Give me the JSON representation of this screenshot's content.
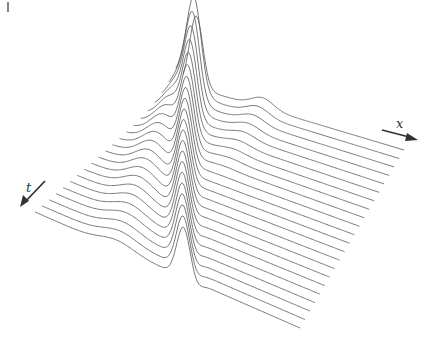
{
  "figure": {
    "axes": {
      "x_label": "x",
      "t_label": "t"
    },
    "colors": {
      "curve": "#555555",
      "axis": "#333333",
      "background": "#ffffff"
    }
  },
  "chart_data": {
    "type": "line",
    "title": "",
    "xlabel": "x",
    "ylabel": "t",
    "num_curves": 22,
    "layout": {
      "back_left": [
        183,
        84
      ],
      "front_left": [
        35,
        212
      ],
      "back_right": [
        404,
        150
      ],
      "front_right": [
        300,
        328
      ]
    },
    "series_description": "Each curve is a time slice; a tall initial peak at u≈0.05 splits into a left-moving packet and a right-moving packet; a small secondary bump travels at u≈0.4 in early slices",
    "pulses": {
      "initial_peak": {
        "u": 0.06,
        "height": 72,
        "width": 0.03
      },
      "left_packet": {
        "u_start": 0.06,
        "u_end": 0.5,
        "height_start": 72,
        "height_end": 14,
        "width": 0.04
      },
      "right_packet": {
        "u_start": 0.06,
        "u_end": 0.94,
        "height_start": 72,
        "height_end": 50,
        "width": 0.025
      },
      "small_bump": {
        "u_start": 0.36,
        "u_end": 0.5,
        "height": 10,
        "width": 0.05
      }
    }
  }
}
